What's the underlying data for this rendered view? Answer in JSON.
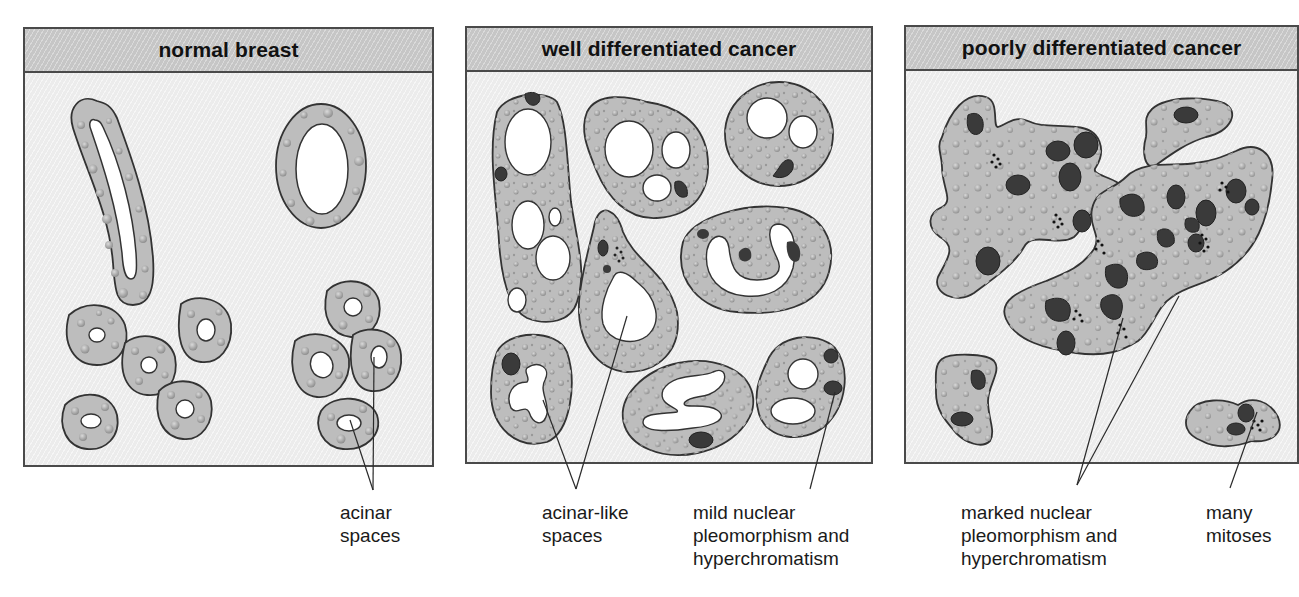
{
  "figure": {
    "panels": [
      {
        "id": "normal",
        "title": "normal breast",
        "annotations": [
          {
            "lines": [
              "acinar",
              "spaces"
            ]
          }
        ]
      },
      {
        "id": "well",
        "title": "well differentiated cancer",
        "annotations": [
          {
            "lines": [
              "acinar-like",
              "spaces"
            ]
          },
          {
            "lines": [
              "mild nuclear",
              "pleomorphism and",
              "hyperchromatism"
            ]
          }
        ]
      },
      {
        "id": "poorly",
        "title": "poorly differentiated cancer",
        "annotations": [
          {
            "lines": [
              "marked nuclear",
              "pleomorphism and",
              "hyperchromatism"
            ]
          },
          {
            "lines": [
              "many",
              "mitoses"
            ]
          }
        ]
      }
    ],
    "colors": {
      "header_fill": "#c6c6c6",
      "body_fill": "#ececec",
      "cell_fill": "#bdbdbd",
      "cell_outline": "#333333",
      "nucleus_fill": "#3a3a3a",
      "lumen_fill": "#ffffff"
    }
  }
}
